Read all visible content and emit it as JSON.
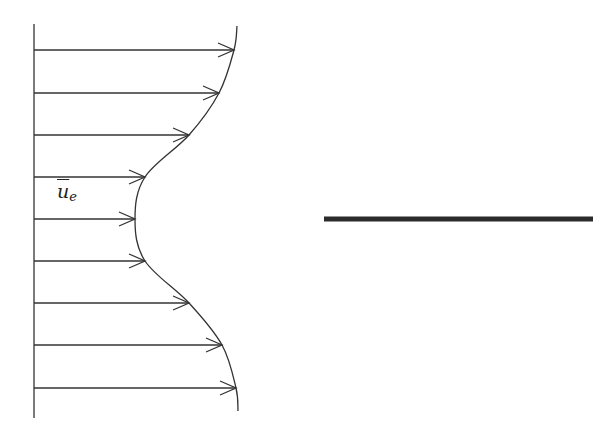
{
  "diagram": {
    "type": "velocity-profile",
    "profile_label": {
      "base": "u",
      "subscript": "e",
      "overbar": true
    },
    "stroke_color": "#333333",
    "plate_color": "#2b2b2b",
    "wall": {
      "x": 34,
      "y_top": 24,
      "y_bottom": 418
    },
    "arrows": [
      {
        "y": 50,
        "tip_x": 234
      },
      {
        "y": 93,
        "tip_x": 219
      },
      {
        "y": 135,
        "tip_x": 189
      },
      {
        "y": 177,
        "tip_x": 145
      },
      {
        "y": 219,
        "tip_x": 135
      },
      {
        "y": 261,
        "tip_x": 145
      },
      {
        "y": 303,
        "tip_x": 189
      },
      {
        "y": 345,
        "tip_x": 222
      },
      {
        "y": 388,
        "tip_x": 236
      }
    ],
    "profile_curve": {
      "start": [
        237,
        26
      ],
      "end": [
        238,
        411
      ]
    },
    "plate": {
      "x1": 324,
      "x2": 593,
      "y": 219,
      "thickness": 5
    }
  }
}
